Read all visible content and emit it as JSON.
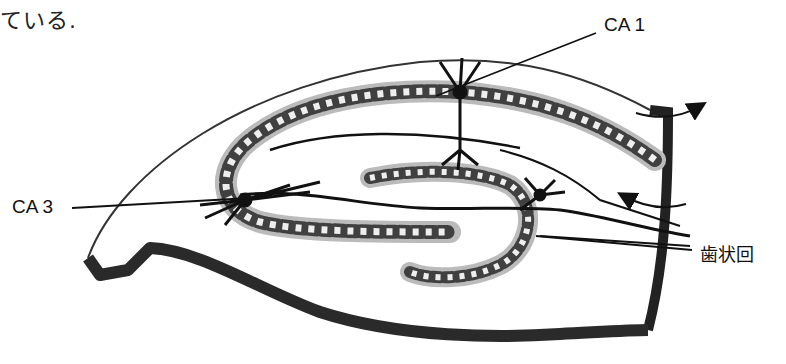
{
  "caption_fragment": "ている.",
  "diagram": {
    "labels": {
      "ca1": "CA 1",
      "ca3": "CA 3",
      "dentate_gyrus": "歯状回"
    },
    "arrows": [
      "curved-arrow-outward",
      "curved-arrow-inward"
    ]
  }
}
